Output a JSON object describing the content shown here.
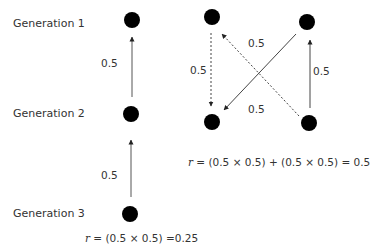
{
  "generations": {
    "gen1": "Generation 1",
    "gen2": "Generation 2",
    "gen3": "Generation 3"
  },
  "left_diagram": {
    "edge_labels": [
      "0.5",
      "0.5"
    ],
    "formula_var": "r",
    "formula_rest": " = (0.5 × 0.5) =0.25"
  },
  "right_diagram": {
    "edge_labels": {
      "dashed_vertical": "0.5",
      "top_diagonal": "0.5",
      "bottom_diagonal": "0.5",
      "solid_vertical": "0.5"
    },
    "formula_var": "r",
    "formula_rest": " = (0.5 × 0.5) + (0.5 × 0.5) = 0.5"
  },
  "colors": {
    "node": "#000000",
    "edge": "#444444",
    "text": "#333333"
  }
}
